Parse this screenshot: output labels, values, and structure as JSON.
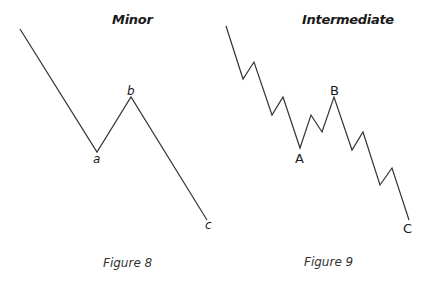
{
  "figures": [
    {
      "title": "Minor",
      "caption": "Figure 8",
      "labels": {
        "a": "a",
        "b": "b",
        "c": "c"
      },
      "points": "20,29 97,152 131,97 207,220"
    },
    {
      "title": "Intermediate",
      "caption": "Figure 9",
      "labels": {
        "A": "A",
        "B": "B",
        "C": "C"
      },
      "points": "226,26 243,79 254,62 272,115 283,97 300,148 311,115 322,132 334,97 352,150 363,132 380,185 392,168 409,220"
    }
  ],
  "colors": {
    "line": "#333333",
    "text": "#1a1a1a",
    "background": "#ffffff"
  }
}
